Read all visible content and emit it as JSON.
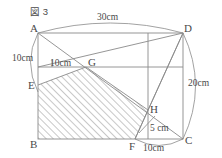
{
  "figure": {
    "caption": "図 3",
    "stroke_color": "#8a8a8a",
    "label_color": "#4a4a4a",
    "hatch_color": "#9a9a9a",
    "background": "#ffffff"
  },
  "points": {
    "A": {
      "label": "A",
      "x": 38,
      "y": 33
    },
    "D": {
      "label": "D",
      "x": 183,
      "y": 33
    },
    "B": {
      "label": "B",
      "x": 38,
      "y": 139
    },
    "C": {
      "label": "C",
      "x": 183,
      "y": 139
    },
    "E": {
      "label": "E",
      "x": 38,
      "y": 85
    },
    "G": {
      "label": "G",
      "x": 86,
      "y": 67
    },
    "H": {
      "label": "H",
      "x": 148,
      "y": 110
    },
    "F": {
      "label": "F",
      "x": 135,
      "y": 139
    }
  },
  "dimensions": {
    "top_arc": "30cm",
    "right_arc": "20cm",
    "left_arc": "10cm",
    "inner_segment": "10cm",
    "h_drop": "5 cm",
    "bottom_arc": "10cm"
  },
  "shaded_region": {
    "name": "hatched-polygon",
    "vertices": "E,G,H,F,B",
    "pattern": "diagonal-hatch"
  }
}
